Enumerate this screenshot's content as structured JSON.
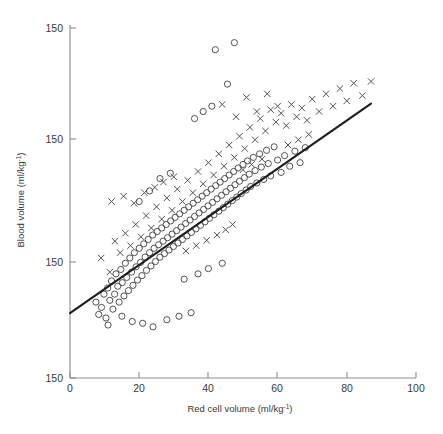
{
  "figure": {
    "background_color": "#ffffff",
    "axis_color": "#8d8d8d",
    "marker_color": "#4a4a4a",
    "line_color": "#1d1d1d"
  },
  "axes": {
    "x_title_main": "Red cell volume (ml/kg",
    "x_title_sup": "-1",
    "x_title_close": ")",
    "y_title_main": "Blood volume (ml/kg",
    "y_title_sup": "-1",
    "y_title_close": ")",
    "x_ticks": [
      "0",
      "20",
      "40",
      "60",
      "80",
      "100"
    ],
    "y_ticks": [
      "150",
      "150",
      "150",
      "150"
    ]
  },
  "chart_data": {
    "type": "scatter",
    "title": "",
    "xlabel": "Red cell volume (ml/kg-1)",
    "ylabel": "Blood volume (ml/kg-1)",
    "xlim": [
      0,
      100
    ],
    "ylim": [
      0,
      4
    ],
    "grid": false,
    "legend": "none",
    "x_tick_values": [
      0,
      20,
      40,
      60,
      80,
      100
    ],
    "y_tick_values": [
      0,
      1,
      2,
      3
    ],
    "y_tick_labels": [
      "150",
      "150",
      "150",
      "150"
    ],
    "fit_line": {
      "label": "regression-line",
      "x_start": 0,
      "y_start": 0.735,
      "x_end": 87,
      "y_end": 3.11
    },
    "series": [
      {
        "name": "circles",
        "marker": "open-circle",
        "points": [
          [
            7.5,
            0.86
          ],
          [
            8.3,
            0.72
          ],
          [
            9.1,
            0.8
          ],
          [
            9.8,
            0.95
          ],
          [
            10.4,
            0.68
          ],
          [
            10.9,
            1.02
          ],
          [
            11.5,
            0.88
          ],
          [
            12.0,
            1.1
          ],
          [
            12.4,
            0.78
          ],
          [
            12.9,
            0.95
          ],
          [
            13.3,
            1.18
          ],
          [
            13.8,
            1.04
          ],
          [
            14.2,
            0.86
          ],
          [
            14.7,
            1.23
          ],
          [
            15.1,
            1.08
          ],
          [
            15.6,
            0.93
          ],
          [
            16.0,
            1.3
          ],
          [
            16.4,
            1.14
          ],
          [
            16.9,
            0.99
          ],
          [
            17.3,
            1.36
          ],
          [
            17.8,
            1.2
          ],
          [
            18.2,
            1.05
          ],
          [
            18.6,
            1.42
          ],
          [
            19.1,
            1.26
          ],
          [
            19.5,
            1.11
          ],
          [
            20.0,
            1.47
          ],
          [
            20.4,
            1.31
          ],
          [
            20.8,
            1.16
          ],
          [
            21.3,
            1.52
          ],
          [
            21.7,
            1.37
          ],
          [
            22.1,
            1.22
          ],
          [
            22.6,
            1.57
          ],
          [
            23.0,
            1.42
          ],
          [
            23.4,
            1.27
          ],
          [
            23.9,
            1.62
          ],
          [
            24.3,
            1.47
          ],
          [
            24.7,
            1.32
          ],
          [
            25.2,
            1.66
          ],
          [
            25.6,
            1.51
          ],
          [
            26.0,
            1.37
          ],
          [
            26.5,
            1.7
          ],
          [
            26.9,
            1.55
          ],
          [
            27.3,
            1.41
          ],
          [
            27.8,
            1.74
          ],
          [
            28.2,
            1.59
          ],
          [
            28.6,
            1.45
          ],
          [
            29.1,
            1.78
          ],
          [
            29.5,
            1.63
          ],
          [
            29.9,
            1.49
          ],
          [
            30.4,
            1.82
          ],
          [
            30.8,
            1.67
          ],
          [
            31.2,
            1.53
          ],
          [
            31.7,
            1.86
          ],
          [
            32.1,
            1.71
          ],
          [
            32.5,
            1.57
          ],
          [
            33.0,
            1.9
          ],
          [
            33.4,
            1.75
          ],
          [
            33.8,
            1.61
          ],
          [
            34.3,
            1.94
          ],
          [
            34.7,
            1.79
          ],
          [
            35.1,
            1.65
          ],
          [
            35.6,
            1.98
          ],
          [
            36.0,
            1.83
          ],
          [
            36.4,
            1.69
          ],
          [
            36.9,
            2.02
          ],
          [
            37.3,
            1.87
          ],
          [
            37.7,
            1.73
          ],
          [
            38.2,
            2.06
          ],
          [
            38.6,
            1.91
          ],
          [
            39.0,
            1.77
          ],
          [
            39.5,
            2.1
          ],
          [
            39.9,
            1.95
          ],
          [
            40.3,
            1.81
          ],
          [
            40.8,
            2.14
          ],
          [
            41.2,
            1.99
          ],
          [
            41.6,
            1.85
          ],
          [
            42.1,
            2.18
          ],
          [
            42.5,
            2.03
          ],
          [
            43.0,
            1.89
          ],
          [
            43.4,
            2.22
          ],
          [
            43.8,
            2.07
          ],
          [
            44.3,
            1.93
          ],
          [
            44.7,
            2.26
          ],
          [
            45.1,
            2.11
          ],
          [
            45.6,
            1.97
          ],
          [
            46.0,
            2.3
          ],
          [
            46.4,
            2.15
          ],
          [
            46.9,
            2.01
          ],
          [
            47.3,
            2.34
          ],
          [
            47.7,
            2.19
          ],
          [
            48.2,
            2.05
          ],
          [
            48.6,
            2.38
          ],
          [
            49.0,
            2.23
          ],
          [
            49.5,
            2.09
          ],
          [
            50.0,
            2.42
          ],
          [
            50.4,
            2.27
          ],
          [
            50.9,
            2.13
          ],
          [
            51.3,
            2.46
          ],
          [
            51.8,
            2.31
          ],
          [
            52.2,
            2.17
          ],
          [
            53.0,
            2.5
          ],
          [
            53.5,
            2.35
          ],
          [
            54.0,
            2.21
          ],
          [
            54.8,
            2.54
          ],
          [
            55.3,
            2.39
          ],
          [
            56.0,
            2.25
          ],
          [
            56.8,
            2.58
          ],
          [
            57.3,
            2.43
          ],
          [
            58.0,
            2.29
          ],
          [
            59.0,
            2.62
          ],
          [
            60.0,
            2.47
          ],
          [
            61.0,
            2.33
          ],
          [
            62.0,
            2.52
          ],
          [
            63.5,
            2.4
          ],
          [
            65.0,
            2.57
          ],
          [
            66.5,
            2.44
          ],
          [
            68.0,
            2.61
          ],
          [
            42.0,
            3.72
          ],
          [
            47.5,
            3.8
          ],
          [
            45.5,
            3.33
          ],
          [
            41.0,
            3.08
          ],
          [
            38.5,
            3.02
          ],
          [
            36.0,
            2.94
          ],
          [
            21.0,
            0.62
          ],
          [
            24.0,
            0.58
          ],
          [
            28.0,
            0.66
          ],
          [
            31.5,
            0.7
          ],
          [
            35.0,
            0.74
          ],
          [
            18.0,
            0.64
          ],
          [
            15.0,
            0.7
          ],
          [
            11.0,
            0.6
          ],
          [
            33.0,
            1.12
          ],
          [
            37.0,
            1.18
          ],
          [
            40.0,
            1.24
          ],
          [
            44.0,
            1.3
          ],
          [
            26.0,
            2.26
          ],
          [
            29.0,
            2.32
          ],
          [
            23.0,
            2.12
          ],
          [
            20.0,
            2.0
          ]
        ]
      },
      {
        "name": "crosses",
        "marker": "cross",
        "points": [
          [
            9.0,
            1.36
          ],
          [
            11.5,
            1.2
          ],
          [
            13.0,
            1.55
          ],
          [
            14.5,
            1.42
          ],
          [
            16.0,
            1.64
          ],
          [
            17.5,
            1.5
          ],
          [
            19.0,
            1.74
          ],
          [
            20.5,
            1.6
          ],
          [
            22.0,
            1.84
          ],
          [
            23.5,
            1.7
          ],
          [
            25.0,
            1.94
          ],
          [
            26.5,
            1.8
          ],
          [
            28.0,
            2.04
          ],
          [
            29.5,
            1.9
          ],
          [
            31.0,
            2.14
          ],
          [
            32.5,
            2.0
          ],
          [
            34.0,
            2.24
          ],
          [
            35.5,
            2.1
          ],
          [
            37.0,
            2.34
          ],
          [
            38.5,
            2.2
          ],
          [
            40.0,
            2.44
          ],
          [
            41.5,
            2.3
          ],
          [
            43.0,
            2.54
          ],
          [
            44.5,
            2.4
          ],
          [
            46.0,
            2.64
          ],
          [
            47.5,
            2.5
          ],
          [
            49.0,
            2.74
          ],
          [
            50.5,
            2.6
          ],
          [
            52.0,
            2.84
          ],
          [
            53.5,
            2.7
          ],
          [
            55.0,
            2.94
          ],
          [
            56.5,
            2.8
          ],
          [
            58.0,
            3.04
          ],
          [
            59.5,
            2.9
          ],
          [
            61.0,
            3.0
          ],
          [
            62.5,
            2.86
          ],
          [
            64.0,
            3.1
          ],
          [
            65.5,
            2.96
          ],
          [
            67.0,
            3.06
          ],
          [
            68.5,
            2.92
          ],
          [
            70.0,
            3.16
          ],
          [
            72.0,
            3.02
          ],
          [
            74.0,
            3.22
          ],
          [
            76.0,
            3.08
          ],
          [
            78.0,
            3.28
          ],
          [
            80.0,
            3.14
          ],
          [
            82.0,
            3.34
          ],
          [
            84.5,
            3.2
          ],
          [
            87.0,
            3.36
          ],
          [
            44.0,
            3.1
          ],
          [
            48.0,
            2.96
          ],
          [
            51.0,
            3.18
          ],
          [
            54.0,
            3.02
          ],
          [
            57.0,
            3.22
          ],
          [
            60.0,
            3.08
          ],
          [
            12.0,
            2.0
          ],
          [
            15.5,
            2.06
          ],
          [
            18.5,
            1.98
          ],
          [
            21.5,
            2.1
          ],
          [
            24.5,
            2.16
          ],
          [
            27.0,
            2.22
          ],
          [
            30.0,
            2.28
          ],
          [
            33.5,
            1.44
          ],
          [
            36.5,
            1.5
          ],
          [
            39.5,
            1.56
          ],
          [
            42.5,
            1.62
          ],
          [
            45.0,
            1.68
          ],
          [
            47.0,
            1.74
          ],
          [
            50.0,
            2.36
          ],
          [
            52.5,
            2.42
          ],
          [
            55.5,
            2.48
          ],
          [
            63.0,
            2.64
          ],
          [
            66.0,
            2.7
          ],
          [
            69.0,
            2.76
          ]
        ]
      }
    ]
  }
}
